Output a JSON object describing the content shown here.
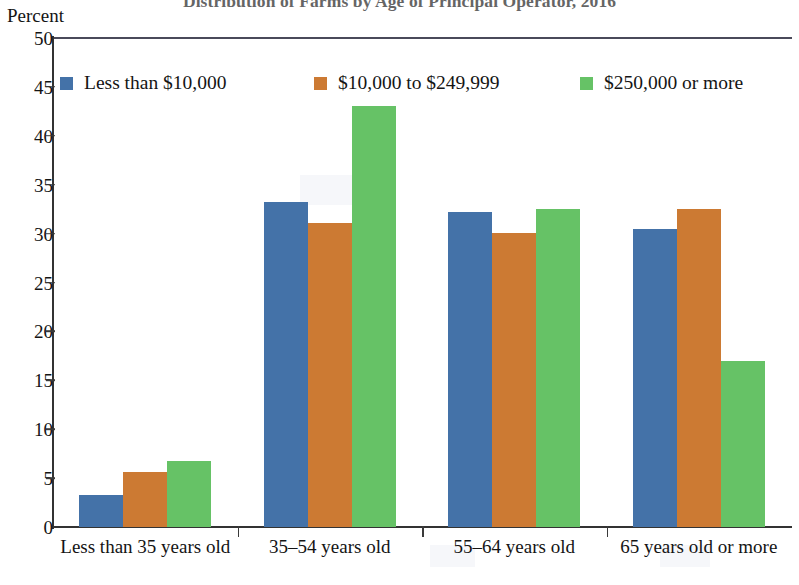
{
  "chart_data": {
    "type": "bar",
    "title": "Distribution of Farms by Age of Principal Operator, 2016",
    "xlabel": "",
    "ylabel": "Percent",
    "ylim": [
      0,
      50
    ],
    "yticks": [
      0,
      5,
      10,
      15,
      20,
      25,
      30,
      35,
      40,
      45,
      50
    ],
    "grid": false,
    "legend_position": "top",
    "categories": [
      "Less than 35 years old",
      "35–54 years old",
      "55–64 years old",
      "65 years old or more"
    ],
    "series": [
      {
        "name": "Less than $10,000",
        "color": "#4472a8",
        "values": [
          3.3,
          33.2,
          32.2,
          30.5
        ]
      },
      {
        "name": "$10,000 to $249,999",
        "color": "#cc7a33",
        "values": [
          5.6,
          31.1,
          30.1,
          32.5
        ]
      },
      {
        "name": "$250,000 or more",
        "color": "#66c266",
        "values": [
          6.7,
          43.0,
          32.5,
          17.0
        ]
      }
    ]
  },
  "axis": {
    "y_title": "Percent",
    "y_tick_labels": [
      "50",
      "45",
      "40",
      "35",
      "30",
      "25",
      "20",
      "15",
      "10",
      "5",
      "0"
    ],
    "x_tick_labels": [
      "Less than 35 years old",
      "35–54 years old",
      "55–64 years old",
      "65 years old or more"
    ]
  },
  "legend": {
    "items": [
      {
        "label": "Less than $10,000"
      },
      {
        "label": "$10,000 to $249,999"
      },
      {
        "label": "$250,000 or more"
      }
    ]
  }
}
